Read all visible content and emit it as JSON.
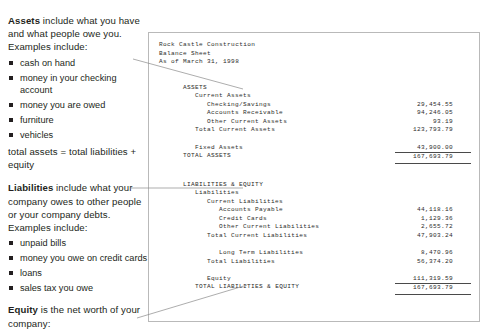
{
  "left_column": {
    "assets": {
      "lead": "Assets",
      "text": " include what you have and what people owe you. Examples include:",
      "bullets": [
        "cash on hand",
        "money in your checking account",
        "money you are owed",
        "furniture",
        "vehicles"
      ],
      "note": "total assets = total liabilities + equity"
    },
    "liabilities": {
      "lead": "Liabilities",
      "text": " include what your company owes to other people or your company debts. Examples include:",
      "bullets": [
        "unpaid bills",
        "money you owe on credit cards",
        "loans",
        "sales tax you owe"
      ]
    },
    "equity": {
      "lead": "Equity",
      "text": " is the net worth of your company:"
    }
  },
  "report": {
    "company": "Rock Castle Construction",
    "title": "Balance Sheet",
    "as_of": "As of March 31, 1998",
    "assets_heading": "ASSETS",
    "current_assets_heading": "Current Assets",
    "rows_assets": [
      {
        "label": "Checking/Savings",
        "amount": "29,454.55",
        "indent": 6,
        "rule": "none"
      },
      {
        "label": "Accounts Receivable",
        "amount": "94,246.05",
        "indent": 6,
        "rule": "none"
      },
      {
        "label": "Other Current Assets",
        "amount": "93.19",
        "indent": 6,
        "rule": "none"
      },
      {
        "label": "Total Current Assets",
        "amount": "123,793.79",
        "indent": 4,
        "rule": "none"
      }
    ],
    "rows_fixed": [
      {
        "label": "Fixed Assets",
        "amount": "43,900.00",
        "indent": 4,
        "rule": "none"
      },
      {
        "label": "TOTAL ASSETS",
        "amount": "167,693.79",
        "indent": 2,
        "rule": "double"
      }
    ],
    "liabilities_heading": "LIABILITIES & EQUITY",
    "liabilities_sub": "Liabilities",
    "current_liabilities_heading": "Current Liabilities",
    "rows_current_liabilities": [
      {
        "label": "Accounts Payable",
        "amount": "44,118.16",
        "indent": 8,
        "rule": "none"
      },
      {
        "label": "Credit Cards",
        "amount": "1,129.36",
        "indent": 8,
        "rule": "none"
      },
      {
        "label": "Other Current Liabilities",
        "amount": "2,655.72",
        "indent": 8,
        "rule": "none"
      },
      {
        "label": "Total Current Liabilities",
        "amount": "47,903.24",
        "indent": 6,
        "rule": "none"
      }
    ],
    "rows_long_term": [
      {
        "label": "Long Term Liabilities",
        "amount": "8,470.96",
        "indent": 8,
        "rule": "none"
      },
      {
        "label": "Total Liabilities",
        "amount": "56,374.20",
        "indent": 6,
        "rule": "none"
      }
    ],
    "rows_equity": [
      {
        "label": "Equity",
        "amount": "111,319.59",
        "indent": 6,
        "rule": "none"
      },
      {
        "label": "TOTAL LIABILITIES & EQUITY",
        "amount": "167,693.79",
        "indent": 4,
        "rule": "double"
      }
    ]
  },
  "colors": {
    "text": "#231f20",
    "report_text": "#2b2b2b",
    "border": "#b9b9b9",
    "connector": "#8a8a8a"
  }
}
